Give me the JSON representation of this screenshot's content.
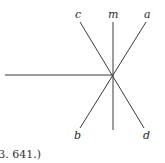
{
  "figure": {
    "labels": {
      "c": "c",
      "m": "m",
      "a": "a",
      "b": "b",
      "d": "d"
    },
    "caption": "(3. 641.)",
    "colors": {
      "line": "#3a3a3a",
      "text": "#2a2a2a",
      "background": "#ffffff"
    }
  }
}
